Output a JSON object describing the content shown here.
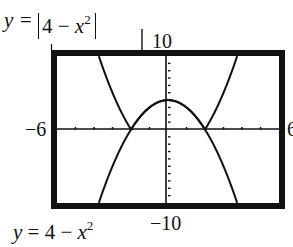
{
  "labels": {
    "top_eq_lhs": "y =",
    "top_eq_inner_num": "4 − ",
    "top_eq_var": "x",
    "top_eq_exp": "2",
    "bottom_eq_lhs": "y = 4 − ",
    "bottom_eq_var": "x",
    "bottom_eq_exp": "2",
    "ymax": "10",
    "ymin": "−10",
    "xmin": "−6",
    "xmax_clipped": "6"
  },
  "window": {
    "xmin": -6,
    "xmax": 6,
    "ymin": -10,
    "ymax": 10,
    "xscl": 1,
    "yscl": 1
  },
  "colors": {
    "ink": "#111111",
    "background": "#ffffff"
  },
  "curves": [
    {
      "name": "abs-parabola",
      "equation": "y = |4 - x^2|"
    },
    {
      "name": "parabola",
      "equation": "y = 4 - x^2"
    }
  ]
}
